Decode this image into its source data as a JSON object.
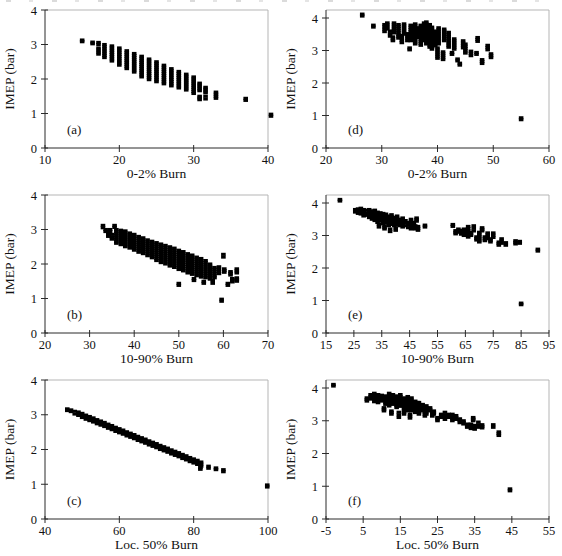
{
  "figure": {
    "marker_color": "#000000",
    "axis_color": "#2a2a2a",
    "frame_color": "#b5b5b5",
    "ylabel_all": "IMEP (bar)",
    "cluster_format": "[burn_value, imep_min_bar, imep_max_bar] - vertical run of cycle data points",
    "marker": "filled-square"
  },
  "chart_data": [
    {
      "id": "a",
      "letter": "(a)",
      "type": "scatter",
      "xlabel": "0-2% Burn",
      "ylabel": "IMEP (bar)",
      "xlim": [
        10,
        40
      ],
      "xticks": [
        10,
        20,
        30,
        40
      ],
      "ylim": [
        0,
        4
      ],
      "yticks": [
        0,
        1,
        2,
        3,
        4
      ],
      "y_top_pad": 0,
      "clusters": [
        [
          15,
          3.08,
          3.13
        ],
        [
          16.4,
          3.02,
          3.07
        ],
        [
          17.2,
          3.0,
          3.06
        ],
        [
          17.2,
          2.72,
          2.9
        ],
        [
          18,
          2.62,
          3.0
        ],
        [
          19,
          2.52,
          2.96
        ],
        [
          20,
          2.4,
          2.9
        ],
        [
          21,
          2.3,
          2.82
        ],
        [
          22,
          2.2,
          2.74
        ],
        [
          23,
          2.06,
          2.66
        ],
        [
          24,
          1.98,
          2.58
        ],
        [
          25,
          1.92,
          2.5
        ],
        [
          26,
          1.86,
          2.4
        ],
        [
          27,
          1.8,
          2.3
        ],
        [
          28,
          1.74,
          2.22
        ],
        [
          29,
          1.68,
          2.14
        ],
        [
          30,
          1.58,
          2.06
        ],
        [
          30.8,
          1.66,
          1.88
        ],
        [
          30.8,
          1.4,
          1.5
        ],
        [
          31.6,
          1.6,
          1.76
        ],
        [
          31.6,
          1.42,
          1.5
        ],
        [
          33,
          1.44,
          1.62
        ],
        [
          37,
          1.38,
          1.44
        ],
        [
          40.4,
          0.92,
          0.98
        ]
      ]
    },
    {
      "id": "d",
      "letter": "(d)",
      "type": "scatter",
      "xlabel": "0-2% Burn",
      "ylabel": "IMEP (bar)",
      "xlim": [
        20,
        60
      ],
      "xticks": [
        20,
        30,
        40,
        50,
        60
      ],
      "ylim": [
        0,
        4
      ],
      "yticks": [
        0,
        1,
        2,
        3,
        4
      ],
      "y_top_pad": 8,
      "clusters": [
        [
          26.5,
          4.06,
          4.12
        ],
        [
          28.5,
          3.72,
          3.78
        ],
        [
          30.5,
          3.58,
          3.8
        ],
        [
          31,
          3.66,
          3.85
        ],
        [
          31.5,
          3.44,
          3.6
        ],
        [
          32,
          3.3,
          3.42
        ],
        [
          32.2,
          3.54,
          3.85
        ],
        [
          33,
          3.38,
          3.8
        ],
        [
          33.6,
          3.24,
          3.46
        ],
        [
          34,
          3.5,
          3.82
        ],
        [
          34.6,
          3.3,
          3.52
        ],
        [
          35,
          3.02,
          3.08
        ],
        [
          35.2,
          3.3,
          3.78
        ],
        [
          36,
          3.2,
          3.82
        ],
        [
          36.6,
          3.4,
          3.7
        ],
        [
          37,
          3.16,
          3.78
        ],
        [
          37.6,
          3.3,
          3.85
        ],
        [
          38,
          3.2,
          3.88
        ],
        [
          38.6,
          3.1,
          3.8
        ],
        [
          39,
          3.04,
          3.72
        ],
        [
          39.6,
          3.14,
          3.6
        ],
        [
          40,
          2.76,
          3.08
        ],
        [
          40.2,
          3.2,
          3.7
        ],
        [
          41,
          2.72,
          2.96
        ],
        [
          41.2,
          3.3,
          3.66
        ],
        [
          42,
          3.1,
          3.56
        ],
        [
          42.6,
          2.88,
          2.94
        ],
        [
          43,
          3.04,
          3.36
        ],
        [
          43.6,
          2.68,
          2.74
        ],
        [
          44,
          2.55,
          2.61
        ],
        [
          44.6,
          3.08,
          3.3
        ],
        [
          45,
          2.92,
          3.2
        ],
        [
          46,
          2.84,
          2.98
        ],
        [
          47,
          2.88,
          2.94
        ],
        [
          47.2,
          3.28,
          3.4
        ],
        [
          48,
          2.6,
          2.72
        ],
        [
          49,
          3.02,
          3.16
        ],
        [
          49.6,
          2.78,
          2.9
        ],
        [
          55,
          0.87,
          0.93
        ]
      ]
    },
    {
      "id": "b",
      "letter": "(b)",
      "type": "scatter",
      "xlabel": "10-90% Burn",
      "ylabel": "IMEP (bar)",
      "xlim": [
        20,
        70
      ],
      "xticks": [
        20,
        30,
        40,
        50,
        60,
        70
      ],
      "ylim": [
        0,
        4
      ],
      "yticks": [
        0,
        1,
        2,
        3,
        4
      ],
      "y_top_pad": 0,
      "clusters": [
        [
          33,
          3.05,
          3.12
        ],
        [
          33.6,
          2.94,
          3.0
        ],
        [
          34.2,
          2.8,
          2.9
        ],
        [
          34.6,
          2.94,
          3.0
        ],
        [
          35,
          2.72,
          2.86
        ],
        [
          35.6,
          3.06,
          3.12
        ],
        [
          36,
          2.6,
          3.0
        ],
        [
          37,
          2.56,
          2.98
        ],
        [
          38,
          2.5,
          2.96
        ],
        [
          39,
          2.46,
          2.9
        ],
        [
          40,
          2.4,
          2.86
        ],
        [
          41,
          2.34,
          2.8
        ],
        [
          42,
          2.3,
          2.76
        ],
        [
          43,
          2.24,
          2.7
        ],
        [
          44,
          2.18,
          2.66
        ],
        [
          45,
          2.1,
          2.62
        ],
        [
          46,
          2.04,
          2.58
        ],
        [
          47,
          2.0,
          2.54
        ],
        [
          48,
          1.94,
          2.5
        ],
        [
          49,
          1.9,
          2.46
        ],
        [
          50,
          1.84,
          2.4
        ],
        [
          50,
          1.38,
          1.44
        ],
        [
          51,
          1.8,
          2.36
        ],
        [
          52,
          1.74,
          2.3
        ],
        [
          53,
          1.7,
          2.26
        ],
        [
          53.4,
          1.52,
          1.58
        ],
        [
          54,
          1.66,
          2.2
        ],
        [
          55,
          1.62,
          2.16
        ],
        [
          55.6,
          1.44,
          1.5
        ],
        [
          56,
          1.6,
          2.1
        ],
        [
          57,
          1.56,
          2.0
        ],
        [
          57.6,
          1.44,
          1.52
        ],
        [
          58,
          1.6,
          1.9
        ],
        [
          59,
          1.72,
          1.92
        ],
        [
          59.6,
          0.92,
          0.98
        ],
        [
          60,
          2.2,
          2.28
        ],
        [
          60.2,
          1.76,
          1.86
        ],
        [
          61,
          1.38,
          1.44
        ],
        [
          61.6,
          1.68,
          1.78
        ],
        [
          62,
          1.48,
          1.58
        ],
        [
          63,
          1.74,
          1.86
        ],
        [
          63,
          1.5,
          1.6
        ]
      ]
    },
    {
      "id": "e",
      "letter": "(e)",
      "type": "scatter",
      "xlabel": "10-90% Burn",
      "ylabel": "IMEP (bar)",
      "xlim": [
        15,
        95
      ],
      "xticks": [
        15,
        25,
        35,
        45,
        55,
        65,
        75,
        85,
        95
      ],
      "ylim": [
        0,
        4
      ],
      "yticks": [
        0,
        1,
        2,
        3,
        4
      ],
      "y_top_pad": 8,
      "clusters": [
        [
          20,
          4.06,
          4.11
        ],
        [
          25.5,
          3.72,
          3.8
        ],
        [
          26.5,
          3.68,
          3.82
        ],
        [
          27.5,
          3.66,
          3.84
        ],
        [
          28.5,
          3.6,
          3.8
        ],
        [
          29.5,
          3.62,
          3.78
        ],
        [
          30.5,
          3.55,
          3.8
        ],
        [
          31.5,
          3.5,
          3.76
        ],
        [
          32.5,
          3.46,
          3.78
        ],
        [
          33.5,
          3.4,
          3.72
        ],
        [
          34,
          3.26,
          3.34
        ],
        [
          34.5,
          3.44,
          3.7
        ],
        [
          35.5,
          3.36,
          3.68
        ],
        [
          36,
          3.2,
          3.3
        ],
        [
          36.5,
          3.4,
          3.66
        ],
        [
          37.5,
          3.3,
          3.6
        ],
        [
          38,
          3.12,
          3.2
        ],
        [
          38.5,
          3.34,
          3.64
        ],
        [
          39.5,
          3.3,
          3.56
        ],
        [
          40,
          3.16,
          3.24
        ],
        [
          40.5,
          3.34,
          3.6
        ],
        [
          41.5,
          3.3,
          3.5
        ],
        [
          42.5,
          3.26,
          3.54
        ],
        [
          43.5,
          3.3,
          3.46
        ],
        [
          44.5,
          3.24,
          3.4
        ],
        [
          45.5,
          3.2,
          3.5
        ],
        [
          46.5,
          3.3,
          3.4
        ],
        [
          47,
          3.2,
          3.3
        ],
        [
          47.5,
          3.44,
          3.54
        ],
        [
          48,
          3.16,
          3.28
        ],
        [
          50.5,
          3.26,
          3.32
        ],
        [
          60.5,
          3.28,
          3.34
        ],
        [
          61.5,
          3.05,
          3.15
        ],
        [
          62.5,
          3.1,
          3.2
        ],
        [
          63.5,
          3.04,
          3.16
        ],
        [
          64.5,
          3.0,
          3.2
        ],
        [
          65.5,
          3.05,
          3.15
        ],
        [
          66,
          2.95,
          3.28
        ],
        [
          67,
          3.0,
          3.1
        ],
        [
          68,
          3.14,
          3.3
        ],
        [
          69,
          2.86,
          2.96
        ],
        [
          70,
          2.8,
          3.1
        ],
        [
          71,
          3.14,
          3.24
        ],
        [
          72,
          2.84,
          2.96
        ],
        [
          73,
          2.9,
          3.08
        ],
        [
          74,
          2.8,
          2.9
        ],
        [
          75,
          2.94,
          3.08
        ],
        [
          77,
          2.7,
          2.8
        ],
        [
          78,
          2.76,
          2.9
        ],
        [
          79.5,
          2.7,
          2.78
        ],
        [
          83,
          2.74,
          2.84
        ],
        [
          84.5,
          2.76,
          2.82
        ],
        [
          85,
          0.87,
          0.92
        ],
        [
          91,
          2.52,
          2.58
        ]
      ]
    },
    {
      "id": "c",
      "letter": "(c)",
      "type": "scatter",
      "xlabel": "Loc. 50% Burn",
      "ylabel": "IMEP (bar)",
      "xlim": [
        40,
        100
      ],
      "xticks": [
        40,
        60,
        80,
        100
      ],
      "ylim": [
        0,
        4
      ],
      "yticks": [
        0,
        1,
        2,
        3,
        4
      ],
      "y_top_pad": 0,
      "clusters": [
        [
          46,
          3.12,
          3.17
        ],
        [
          47,
          3.09,
          3.14
        ],
        [
          48,
          3.02,
          3.1
        ],
        [
          49,
          2.98,
          3.08
        ],
        [
          50,
          2.92,
          3.04
        ],
        [
          51,
          2.87,
          2.99
        ],
        [
          52,
          2.83,
          2.95
        ],
        [
          53,
          2.79,
          2.91
        ],
        [
          54,
          2.74,
          2.86
        ],
        [
          55,
          2.7,
          2.82
        ],
        [
          56,
          2.66,
          2.78
        ],
        [
          57,
          2.61,
          2.73
        ],
        [
          58,
          2.57,
          2.69
        ],
        [
          59,
          2.52,
          2.64
        ],
        [
          60,
          2.48,
          2.6
        ],
        [
          61,
          2.44,
          2.56
        ],
        [
          62,
          2.39,
          2.51
        ],
        [
          63,
          2.35,
          2.47
        ],
        [
          64,
          2.31,
          2.43
        ],
        [
          65,
          2.26,
          2.38
        ],
        [
          66,
          2.22,
          2.34
        ],
        [
          67,
          2.18,
          2.3
        ],
        [
          68,
          2.13,
          2.25
        ],
        [
          69,
          2.09,
          2.21
        ],
        [
          70,
          2.05,
          2.17
        ],
        [
          71,
          2.0,
          2.12
        ],
        [
          72,
          1.96,
          2.08
        ],
        [
          73,
          1.92,
          2.04
        ],
        [
          74,
          1.87,
          1.99
        ],
        [
          75,
          1.83,
          1.95
        ],
        [
          76,
          1.79,
          1.91
        ],
        [
          77,
          1.74,
          1.86
        ],
        [
          78,
          1.7,
          1.82
        ],
        [
          79,
          1.65,
          1.77
        ],
        [
          80,
          1.61,
          1.73
        ],
        [
          81,
          1.57,
          1.69
        ],
        [
          82,
          1.52,
          1.64
        ],
        [
          81.8,
          1.43,
          1.48
        ],
        [
          84,
          1.46,
          1.52
        ],
        [
          86,
          1.42,
          1.47
        ],
        [
          88,
          1.36,
          1.42
        ],
        [
          99.8,
          0.92,
          0.98
        ]
      ]
    },
    {
      "id": "f",
      "letter": "(f)",
      "type": "scatter",
      "xlabel": "Loc. 50% Burn",
      "ylabel": "IMEP (bar)",
      "xlim": [
        -5,
        55
      ],
      "xticks": [
        -5,
        5,
        15,
        25,
        35,
        45,
        55
      ],
      "ylim": [
        0,
        4
      ],
      "yticks": [
        0,
        1,
        2,
        3,
        4
      ],
      "y_top_pad": 8,
      "clusters": [
        [
          -3,
          4.06,
          4.11
        ],
        [
          6,
          3.6,
          3.7
        ],
        [
          7,
          3.66,
          3.8
        ],
        [
          8,
          3.58,
          3.84
        ],
        [
          9,
          3.55,
          3.8
        ],
        [
          10,
          3.6,
          3.78
        ],
        [
          10.6,
          3.3,
          3.4
        ],
        [
          11,
          3.5,
          3.76
        ],
        [
          12,
          3.45,
          3.84
        ],
        [
          12.6,
          3.2,
          3.3
        ],
        [
          13,
          3.5,
          3.8
        ],
        [
          14,
          3.4,
          3.76
        ],
        [
          14.6,
          3.1,
          3.26
        ],
        [
          15,
          3.44,
          3.8
        ],
        [
          16,
          3.2,
          3.7
        ],
        [
          17,
          3.3,
          3.74
        ],
        [
          17.6,
          3.08,
          3.2
        ],
        [
          18,
          3.3,
          3.7
        ],
        [
          19,
          3.25,
          3.6
        ],
        [
          19.6,
          3.4,
          3.56
        ],
        [
          20,
          3.2,
          3.56
        ],
        [
          21,
          3.3,
          3.5
        ],
        [
          21.6,
          3.14,
          3.26
        ],
        [
          22,
          3.2,
          3.46
        ],
        [
          23,
          3.3,
          3.4
        ],
        [
          23.6,
          3.14,
          3.26
        ],
        [
          24,
          3.2,
          3.3
        ],
        [
          25,
          3.0,
          3.1
        ],
        [
          26,
          3.1,
          3.2
        ],
        [
          27,
          3.04,
          3.26
        ],
        [
          28,
          3.1,
          3.2
        ],
        [
          29,
          3.0,
          3.2
        ],
        [
          30,
          3.04,
          3.16
        ],
        [
          31,
          2.94,
          3.06
        ],
        [
          32,
          2.9,
          3.0
        ],
        [
          33,
          2.8,
          2.9
        ],
        [
          34,
          2.76,
          2.9
        ],
        [
          34.6,
          3.0,
          3.1
        ],
        [
          35,
          2.74,
          2.86
        ],
        [
          36,
          2.8,
          2.96
        ],
        [
          37,
          2.78,
          2.88
        ],
        [
          40,
          2.8,
          2.88
        ],
        [
          41.5,
          2.55,
          2.66
        ],
        [
          44.5,
          0.86,
          0.92
        ]
      ]
    }
  ]
}
